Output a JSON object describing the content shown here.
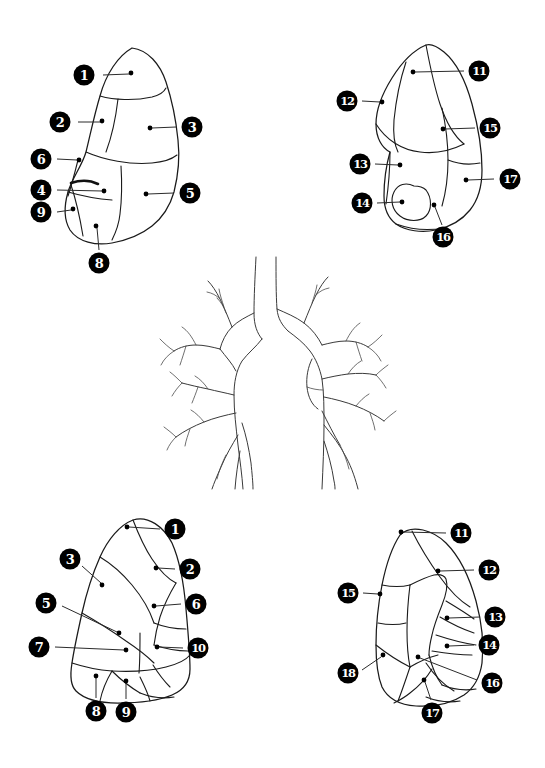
{
  "figure": {
    "background_color": "#ffffff",
    "ink_color": "#1a1a1a",
    "badge_fill": "#000000",
    "badge_text_color": "#ffffff",
    "width": 545,
    "height": 768
  },
  "panels": [
    {
      "id": "top-left",
      "name": "right-lung-lateral-view",
      "labels": [
        {
          "number": "1",
          "badge_x": 84,
          "badge_y": 75,
          "dot_x": 131,
          "dot_y": 73,
          "leader": [
            103,
            75,
            129,
            74
          ]
        },
        {
          "number": "2",
          "badge_x": 60,
          "badge_y": 122,
          "dot_x": 102,
          "dot_y": 121,
          "leader": [
            78,
            122,
            100,
            122
          ]
        },
        {
          "number": "3",
          "badge_x": 192,
          "badge_y": 127,
          "dot_x": 150,
          "dot_y": 128,
          "leader": [
            152,
            128,
            176,
            127
          ]
        },
        {
          "number": "6",
          "badge_x": 41,
          "badge_y": 159,
          "dot_x": 79,
          "dot_y": 160,
          "leader": [
            57,
            159,
            77,
            160
          ]
        },
        {
          "number": "4",
          "badge_x": 41,
          "badge_y": 190,
          "dot_x": 104,
          "dot_y": 191,
          "leader": [
            57,
            190,
            102,
            191
          ]
        },
        {
          "number": "5",
          "badge_x": 190,
          "badge_y": 193,
          "dot_x": 146,
          "dot_y": 194,
          "leader": [
            148,
            194,
            174,
            193
          ]
        },
        {
          "number": "9",
          "badge_x": 41,
          "badge_y": 212,
          "dot_x": 73,
          "dot_y": 209,
          "leader": [
            57,
            212,
            71,
            210
          ]
        },
        {
          "number": "8",
          "badge_x": 99,
          "badge_y": 263,
          "dot_x": 96,
          "dot_y": 226,
          "leader": [
            97,
            228,
            99,
            250
          ]
        }
      ]
    },
    {
      "id": "top-right",
      "name": "left-lung-lateral-view",
      "labels": [
        {
          "number": "11",
          "badge_x": 479,
          "badge_y": 71,
          "dot_x": 413,
          "dot_y": 72,
          "leader": [
            415,
            72,
            464,
            71
          ]
        },
        {
          "number": "12",
          "badge_x": 347,
          "badge_y": 101,
          "dot_x": 382,
          "dot_y": 102,
          "leader": [
            362,
            101,
            380,
            102
          ]
        },
        {
          "number": "15",
          "badge_x": 490,
          "badge_y": 128,
          "dot_x": 443,
          "dot_y": 129,
          "leader": [
            445,
            129,
            475,
            128
          ]
        },
        {
          "number": "13",
          "badge_x": 360,
          "badge_y": 164,
          "dot_x": 400,
          "dot_y": 165,
          "leader": [
            375,
            164,
            398,
            165
          ]
        },
        {
          "number": "17",
          "badge_x": 510,
          "badge_y": 179,
          "dot_x": 466,
          "dot_y": 180,
          "leader": [
            468,
            180,
            494,
            179
          ]
        },
        {
          "number": "14",
          "badge_x": 362,
          "badge_y": 203,
          "dot_x": 402,
          "dot_y": 202,
          "leader": [
            377,
            203,
            400,
            202
          ]
        },
        {
          "number": "16",
          "badge_x": 443,
          "badge_y": 237,
          "dot_x": 434,
          "dot_y": 205,
          "leader": [
            435,
            207,
            442,
            225
          ]
        }
      ]
    },
    {
      "id": "bottom-left",
      "name": "right-lung-medial-view",
      "labels": [
        {
          "number": "1",
          "badge_x": 175,
          "badge_y": 529,
          "dot_x": 127,
          "dot_y": 527,
          "leader": [
            129,
            527,
            160,
            529
          ]
        },
        {
          "number": "3",
          "badge_x": 70,
          "badge_y": 559,
          "dot_x": 102,
          "dot_y": 585,
          "leader": [
            82,
            566,
            101,
            583
          ]
        },
        {
          "number": "2",
          "badge_x": 190,
          "badge_y": 569,
          "dot_x": 156,
          "dot_y": 568,
          "leader": [
            158,
            568,
            175,
            569
          ]
        },
        {
          "number": "5",
          "badge_x": 46,
          "badge_y": 603,
          "dot_x": 119,
          "dot_y": 633,
          "leader": [
            62,
            606,
            117,
            632
          ]
        },
        {
          "number": "6",
          "badge_x": 196,
          "badge_y": 604,
          "dot_x": 154,
          "dot_y": 606,
          "leader": [
            156,
            606,
            181,
            604
          ]
        },
        {
          "number": "7",
          "badge_x": 39,
          "badge_y": 647,
          "dot_x": 126,
          "dot_y": 650,
          "leader": [
            55,
            647,
            124,
            650
          ]
        },
        {
          "number": "10",
          "badge_x": 198,
          "badge_y": 648,
          "dot_x": 157,
          "dot_y": 647,
          "leader": [
            159,
            647,
            183,
            648
          ]
        },
        {
          "number": "8",
          "badge_x": 96,
          "badge_y": 711,
          "dot_x": 96,
          "dot_y": 676,
          "leader": [
            96,
            678,
            96,
            698
          ]
        },
        {
          "number": "9",
          "badge_x": 126,
          "badge_y": 712,
          "dot_x": 126,
          "dot_y": 681,
          "leader": [
            126,
            683,
            126,
            699
          ]
        }
      ]
    },
    {
      "id": "bottom-right",
      "name": "left-lung-medial-view",
      "labels": [
        {
          "number": "11",
          "badge_x": 461,
          "badge_y": 533,
          "dot_x": 401,
          "dot_y": 532,
          "leader": [
            403,
            532,
            446,
            533
          ]
        },
        {
          "number": "12",
          "badge_x": 489,
          "badge_y": 570,
          "dot_x": 438,
          "dot_y": 571,
          "leader": [
            440,
            571,
            474,
            570
          ]
        },
        {
          "number": "15",
          "badge_x": 348,
          "badge_y": 593,
          "dot_x": 380,
          "dot_y": 594,
          "leader": [
            363,
            593,
            378,
            594
          ]
        },
        {
          "number": "13",
          "badge_x": 495,
          "badge_y": 617,
          "dot_x": 447,
          "dot_y": 618,
          "leader": [
            449,
            618,
            480,
            617
          ]
        },
        {
          "number": "14",
          "badge_x": 489,
          "badge_y": 645,
          "dot_x": 447,
          "dot_y": 646,
          "leader": [
            449,
            646,
            474,
            645
          ]
        },
        {
          "number": "18",
          "badge_x": 348,
          "badge_y": 673,
          "dot_x": 383,
          "dot_y": 655,
          "leader": [
            362,
            670,
            381,
            657
          ]
        },
        {
          "number": "16",
          "badge_x": 492,
          "badge_y": 683,
          "dot_x": 418,
          "dot_y": 657,
          "leader": [
            420,
            658,
            477,
            680
          ]
        },
        {
          "number": "17",
          "badge_x": 432,
          "badge_y": 713,
          "dot_x": 424,
          "dot_y": 680,
          "leader": [
            425,
            682,
            431,
            700
          ]
        }
      ]
    }
  ],
  "bronchial_tree": {
    "name": "central-bronchial-tree",
    "description": "trachea with bilateral bronchial branching"
  }
}
